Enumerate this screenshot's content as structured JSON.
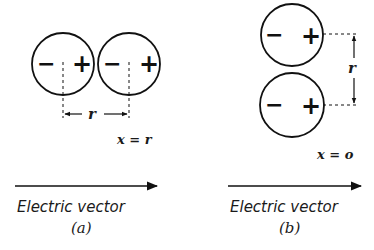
{
  "panels": [
    {
      "id": "a",
      "caption": "(a)",
      "condition": "x = r",
      "distance_label": "r",
      "vector_label": "Electric vector",
      "dipoles": [
        {
          "negative": "−",
          "positive": "+"
        },
        {
          "negative": "−",
          "positive": "+"
        }
      ],
      "arrangement": "side-by-side (collinear along field)"
    },
    {
      "id": "b",
      "caption": "(b)",
      "condition": "x = o",
      "distance_label": "r",
      "vector_label": "Electric vector",
      "dipoles": [
        {
          "negative": "−",
          "positive": "+"
        },
        {
          "negative": "−",
          "positive": "+"
        }
      ],
      "arrangement": "stacked (parallel, perpendicular offset)"
    }
  ],
  "colors": {
    "ink": "#111111",
    "background": "#ffffff"
  }
}
